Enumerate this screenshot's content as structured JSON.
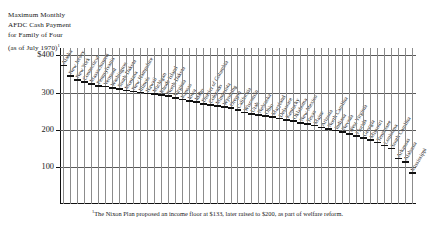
{
  "title": {
    "line1": "Maximum Monthly",
    "line2": "AFDC Cash Payment",
    "line3": "for Family of Four",
    "line4": "(as of July 1970)",
    "line4_sup": "1"
  },
  "footnote": {
    "marker": "1",
    "text": "The Nixon Plan proposed an income floor at $133, later raised to $200, as part of welfare reform."
  },
  "chart_data": {
    "type": "bar",
    "title": "Maximum Monthly AFDC Cash Payment for Family of Four (as of July 1970)",
    "xlabel": "",
    "ylabel": "",
    "ylim": [
      0,
      420
    ],
    "grid": true,
    "legend": "none",
    "ytick_labels": [
      "$400",
      "300",
      "200",
      "100"
    ],
    "ytick_values": [
      400,
      300,
      200,
      100
    ],
    "categories": [
      "Alaska",
      "New Jersey",
      "New York",
      "Connecticut",
      "Massachusetts",
      "Pennsylvania",
      "Vermont",
      "Washington",
      "South Dakota",
      "Montana",
      "New Hampshire",
      "Illinois",
      "Hawaii",
      "Michigan",
      "Rhode Island",
      "North Dakota",
      "Virginia",
      "Kansas",
      "Iowa",
      "Idaho",
      "District of Columbia",
      "Colorado",
      "Minnesota",
      "Wyoming",
      "Oregon",
      "California",
      "Wisconsin",
      "Utah",
      "Nebraska",
      "Ohio",
      "Maryland",
      "Delaware",
      "Kentucky",
      "Oklahoma",
      "New Mexico",
      "Texas",
      "Maine",
      "Arizona",
      "North Carolina",
      "Indiana",
      "Nevada",
      "West Virginia",
      "Florida",
      "Georgia",
      "Missouri",
      "Tennessee",
      "Louisiana",
      "South Carolina",
      "Arkansas",
      "Alabama",
      "Mississippi"
    ],
    "values": [
      375,
      347,
      336,
      330,
      326,
      320,
      318,
      315,
      311,
      308,
      305,
      302,
      300,
      298,
      296,
      293,
      288,
      283,
      279,
      276,
      272,
      268,
      266,
      263,
      260,
      256,
      248,
      245,
      242,
      239,
      236,
      232,
      229,
      225,
      221,
      217,
      213,
      208,
      204,
      200,
      196,
      190,
      185,
      180,
      175,
      168,
      160,
      152,
      125,
      115,
      85
    ]
  }
}
